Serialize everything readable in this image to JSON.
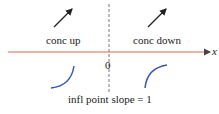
{
  "diagram": {
    "left_label": "conc up",
    "right_label": "conc down",
    "origin_label": "0",
    "axis_label": "x",
    "bottom_label": "infl point slope = 1",
    "colors": {
      "axis": "#d9694f",
      "curve": "#3a5aa8",
      "arrow": "#222222",
      "dashed": "#555555"
    }
  }
}
